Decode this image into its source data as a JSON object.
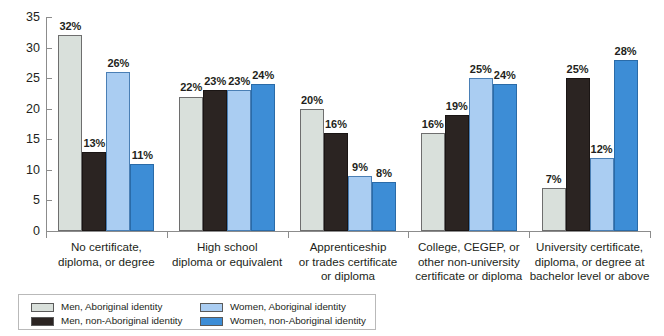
{
  "chart_data": {
    "type": "bar",
    "title": "",
    "subtitle": "",
    "xlabel": "",
    "ylabel": "",
    "ylim": [
      0,
      35
    ],
    "ytick_values": [
      0,
      5,
      10,
      15,
      20,
      25,
      30,
      35
    ],
    "ytick_labels": [
      "0",
      "5",
      "10",
      "15",
      "20",
      "25",
      "30",
      "35"
    ],
    "grid": false,
    "legend_position": "bottom-left",
    "value_label_suffix": "%",
    "categories": [
      "No certificate, diploma, or degree",
      "High school diploma or equivalent",
      "Apprenticeship or trades certificate or diploma",
      "College, CEGEP, or other non-university certificate or diploma",
      "University certificate, diploma, or degree at bachelor level or above"
    ],
    "category_lines": [
      [
        "No certificate,",
        "diploma, or degree"
      ],
      [
        "High school",
        "diploma or equivalent"
      ],
      [
        "Apprenticeship",
        "or trades certificate",
        "or diploma"
      ],
      [
        "College, CEGEP, or",
        "other non-university",
        "certificate or diploma"
      ],
      [
        "University certificate,",
        "diploma, or degree at",
        "bachelor level or above"
      ]
    ],
    "series": [
      {
        "name": "Men, Aboriginal identity",
        "color": "#d9e0db",
        "border": "#6e6e6e",
        "values": [
          32,
          22,
          20,
          16,
          7
        ],
        "labels": [
          "32%",
          "22%",
          "20%",
          "16%",
          "7%"
        ]
      },
      {
        "name": "Men, non-Aboriginal identity",
        "color": "#2b2422",
        "border": "#1a1514",
        "values": [
          13,
          23,
          16,
          19,
          25
        ],
        "labels": [
          "13%",
          "23%",
          "16%",
          "19%",
          "25%"
        ]
      },
      {
        "name": "Women, Aboriginal identity",
        "color": "#aacdf2",
        "border": "#4a7fb5",
        "values": [
          26,
          23,
          9,
          25,
          12
        ],
        "labels": [
          "26%",
          "23%",
          "9%",
          "25%",
          "12%"
        ]
      },
      {
        "name": "Women, non-Aboriginal identity",
        "color": "#3d8dd6",
        "border": "#2a6ba8",
        "values": [
          11,
          24,
          8,
          24,
          28
        ],
        "labels": [
          "11%",
          "24%",
          "8%",
          "24%",
          "28%"
        ]
      }
    ]
  },
  "legend": {
    "items": [
      {
        "label": "Men, Aboriginal identity",
        "color": "#d9e0db"
      },
      {
        "label": "Men, non-Aboriginal identity",
        "color": "#2b2422"
      },
      {
        "label": "Women, Aboriginal identity",
        "color": "#aacdf2"
      },
      {
        "label": "Women, non-Aboriginal identity",
        "color": "#3d8dd6"
      }
    ]
  }
}
